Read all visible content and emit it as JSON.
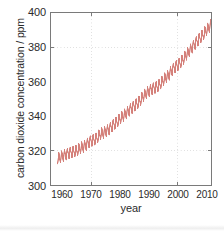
{
  "chart_data": {
    "type": "line",
    "title": "",
    "xlabel": "year",
    "ylabel": "carbon dioxide concentration / ppm",
    "xlim": [
      1957.0,
      1958.0
    ],
    "ylim": [
      300,
      400
    ],
    "xticks": [
      1960,
      1970,
      1980,
      1990,
      2000,
      2010
    ],
    "xtick_labels": [
      "1960",
      "1970",
      "1980",
      "1990",
      "2000",
      "2010"
    ],
    "yticks": [
      300,
      320,
      340,
      360,
      380,
      400
    ],
    "ytick_labels": [
      "300",
      "320",
      "340",
      "360",
      "380",
      "400"
    ],
    "grid": true,
    "grid_style": "dotted",
    "legend": "none",
    "line_color": "#d4807a",
    "axis_color": "#7a7a7a",
    "text_color": "#2b2b2b",
    "grid_color": "#c8c8c8",
    "background": "#ffffff",
    "series": [
      {
        "name": "Mauna Loa atmospheric CO2 (Keeling Curve)",
        "description": "Monthly mean CO2 concentration showing long-term rise with a seasonal sawtooth oscillation of roughly 6 ppm peak-to-peak.",
        "seasonal_amplitude_ppm": 3.0,
        "x": [
          1958,
          1959,
          1960,
          1961,
          1962,
          1963,
          1964,
          1965,
          1966,
          1967,
          1968,
          1969,
          1970,
          1971,
          1972,
          1973,
          1974,
          1975,
          1976,
          1977,
          1978,
          1979,
          1980,
          1981,
          1982,
          1983,
          1984,
          1985,
          1986,
          1987,
          1988,
          1989,
          1990,
          1991,
          1992,
          1993,
          1994,
          1995,
          1996,
          1997,
          1998,
          1999,
          2000,
          2001,
          2002,
          2003,
          2004,
          2005,
          2006,
          2007,
          2008,
          2009,
          2010,
          2011,
          2012
        ],
        "y": [
          315.3,
          315.9,
          316.9,
          317.6,
          318.4,
          318.9,
          319.5,
          320.0,
          321.3,
          322.1,
          323.0,
          324.6,
          325.6,
          326.3,
          327.4,
          329.6,
          330.2,
          331.1,
          332.0,
          333.8,
          335.4,
          336.8,
          338.7,
          340.1,
          341.4,
          343.0,
          344.6,
          346.0,
          347.4,
          349.2,
          351.6,
          353.1,
          354.4,
          355.6,
          356.4,
          357.1,
          358.8,
          360.8,
          362.6,
          363.8,
          366.6,
          368.3,
          369.5,
          371.0,
          373.1,
          375.6,
          377.4,
          379.6,
          381.8,
          383.7,
          385.6,
          387.4,
          389.8,
          391.6,
          393.8
        ]
      }
    ]
  },
  "axis": {
    "ylabel_text": "carbon dioxide concentration / ppm",
    "xlabel_text": "year"
  }
}
